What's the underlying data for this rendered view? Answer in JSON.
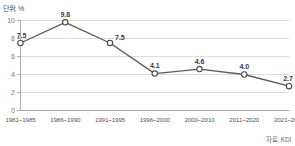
{
  "chart_data": {
    "type": "line",
    "title": "",
    "unit_label": "단위: %",
    "source_label": "자료: KDI",
    "xlabel": "",
    "ylabel": "",
    "categories": [
      "1981~1985",
      "1986~1990",
      "1991~1995",
      "1996~2000",
      "2000~2010",
      "2011~2020",
      "2021~2030"
    ],
    "values": [
      7.5,
      9.8,
      7.5,
      4.1,
      4.6,
      4.0,
      2.7
    ],
    "point_labels": [
      "7.5",
      "9.8",
      "7.5",
      "4.1",
      "4.6",
      "4.0",
      "2.7"
    ],
    "ylim": [
      0,
      10
    ],
    "yticks": [
      0,
      2,
      4,
      6,
      8,
      10
    ],
    "ytick_labels": [
      "0",
      "2",
      "4",
      "6",
      "8",
      "10"
    ],
    "grid": true,
    "legend": "none",
    "colors": {
      "line": "#5a5a5a",
      "marker_fill": "#ffffff",
      "marker_stroke": "#4a4a4a",
      "gridline": "#cdcdcd",
      "axis": "#9a9a9a",
      "background": "#ffffff",
      "value_text": "#3a3a3a",
      "tick_text": "#777777"
    }
  }
}
